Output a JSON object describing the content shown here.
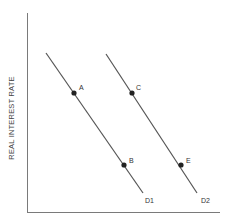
{
  "diagram": {
    "y_axis_label": "REAL INTEREST RATE",
    "x_axis_label": "",
    "curves": [
      {
        "name": "D1",
        "label": "D1"
      },
      {
        "name": "D2",
        "label": "D2"
      }
    ],
    "points": [
      {
        "label": "A",
        "curve": "D1"
      },
      {
        "label": "B",
        "curve": "D1"
      },
      {
        "label": "C",
        "curve": "D2"
      },
      {
        "label": "E",
        "curve": "D2"
      }
    ],
    "colors": {
      "line": "#555555",
      "axis": "#777777",
      "point": "#222222"
    }
  }
}
